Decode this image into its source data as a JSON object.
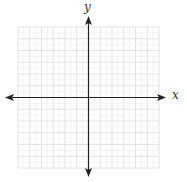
{
  "diagram": {
    "type": "coordinate-plane",
    "x_label": "x",
    "y_label": "y",
    "grid": {
      "cells_x": 12,
      "cells_y": 12,
      "left": 18,
      "top": 27,
      "cell_size": 11.75,
      "line_color": "#e2e2e2",
      "origin_x": 88.5,
      "origin_y": 97.5
    },
    "axes": {
      "color": "#222222",
      "x_start": 5,
      "x_end": 166,
      "y_start": 16,
      "y_end": 177
    }
  }
}
